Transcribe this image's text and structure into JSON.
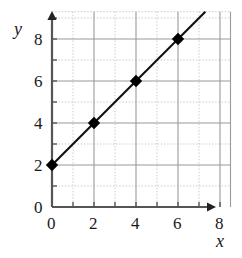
{
  "chart_data": {
    "type": "line",
    "title": "",
    "subtitle": "",
    "xlabel": "x",
    "ylabel": "y",
    "xlim": [
      0,
      8.5
    ],
    "ylim": [
      0,
      9.3
    ],
    "x_ticks": [
      0,
      1,
      2,
      3,
      4,
      5,
      6,
      7,
      8
    ],
    "y_ticks": [
      0,
      1,
      2,
      3,
      4,
      5,
      6,
      7,
      8,
      9
    ],
    "x_tick_labels": [
      "0",
      "2",
      "4",
      "6",
      "8"
    ],
    "x_tick_label_values": [
      0,
      2,
      4,
      6,
      8
    ],
    "y_tick_labels": [
      "0",
      "2",
      "4",
      "6",
      "8"
    ],
    "y_tick_label_values": [
      0,
      2,
      4,
      6,
      8
    ],
    "grid": true,
    "grid_major_spacing": 2,
    "grid_minor_spacing": 1,
    "legend": "none",
    "equation": "y = x + 2",
    "slope": 1,
    "intercept": 2,
    "line_extent": {
      "x_start": 0,
      "y_start": 2,
      "x_end": 7.3,
      "y_end": 9.3
    },
    "marker": "diamond",
    "series": [
      {
        "name": "y = x + 2",
        "x": [
          0,
          2,
          4,
          6
        ],
        "values": [
          2,
          4,
          6,
          8
        ],
        "points": [
          [
            0,
            2
          ],
          [
            2,
            4
          ],
          [
            4,
            6
          ],
          [
            6,
            8
          ]
        ]
      }
    ],
    "colors": {
      "line": "#111111",
      "marker": "#000000",
      "axis": "#555555",
      "grid_major": "#9a9a9a",
      "grid_minor": "#c8c8c8",
      "background": "#ffffff",
      "text": "#1a1a1a"
    },
    "axes": {
      "x_arrow": true,
      "y_arrow": true
    }
  }
}
